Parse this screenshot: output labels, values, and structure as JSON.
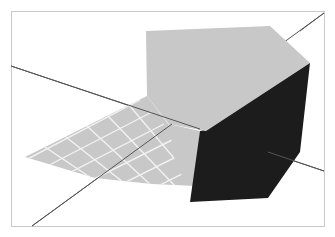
{
  "figure": {
    "width": 335,
    "height": 237,
    "background_color": "#ffffff",
    "type": "3d-surface-plot"
  },
  "frame": {
    "stroke_color": "#c9c9c9",
    "stroke_width": 1,
    "x": 11,
    "y": 11,
    "width": 313,
    "height": 215
  },
  "colors": {
    "surface_light": "#c8c8c8",
    "surface_dark": "#1c1c1c",
    "grid_line": "#f2f2f2",
    "axis_line": "#555555",
    "frame": "#c9c9c9",
    "background": "#ffffff"
  },
  "chart_data": {
    "type": "surface",
    "title": "",
    "xlabel": "",
    "ylabel": "",
    "zlabel": "",
    "grid": true,
    "legend": "none",
    "axis_lines": [
      {
        "name": "axis-line-descending",
        "from": [
          11,
          66
        ],
        "to": [
          324,
          171
        ],
        "color": "#555555"
      },
      {
        "name": "axis-line-ascending",
        "from": [
          32,
          226
        ],
        "to": [
          324,
          13
        ],
        "color": "#555555"
      }
    ],
    "surfaces": [
      {
        "name": "upper-light-facet",
        "shade": "light",
        "fill": "#c8c8c8",
        "points": [
          [
            146,
            31
          ],
          [
            270,
            26
          ],
          [
            310,
            63
          ],
          [
            206,
            131
          ],
          [
            169,
            124
          ],
          [
            147,
            96
          ]
        ]
      },
      {
        "name": "dark-vertical-facet",
        "shade": "dark",
        "fill": "#1c1c1c",
        "points": [
          [
            310,
            63
          ],
          [
            300,
            152
          ],
          [
            268,
            198
          ],
          [
            190,
            202
          ],
          [
            200,
            131
          ],
          [
            206,
            131
          ]
        ]
      },
      {
        "name": "lower-grid-facet",
        "shade": "light",
        "fill": "#c8c8c8",
        "points": [
          [
            25,
            157
          ],
          [
            147,
            96
          ],
          [
            169,
            124
          ],
          [
            196,
            186
          ],
          [
            152,
            184
          ],
          [
            95,
            178
          ]
        ]
      },
      {
        "name": "lower-right-wedge",
        "shade": "light",
        "fill": "#c8c8c8",
        "points": [
          [
            169,
            124
          ],
          [
            200,
            131
          ],
          [
            196,
            186
          ],
          [
            176,
            170
          ]
        ]
      }
    ],
    "mesh": {
      "enabled": true,
      "color": "#f2f2f2",
      "u_lines": 6,
      "v_lines": 6,
      "region": "lower-grid-facet"
    }
  }
}
